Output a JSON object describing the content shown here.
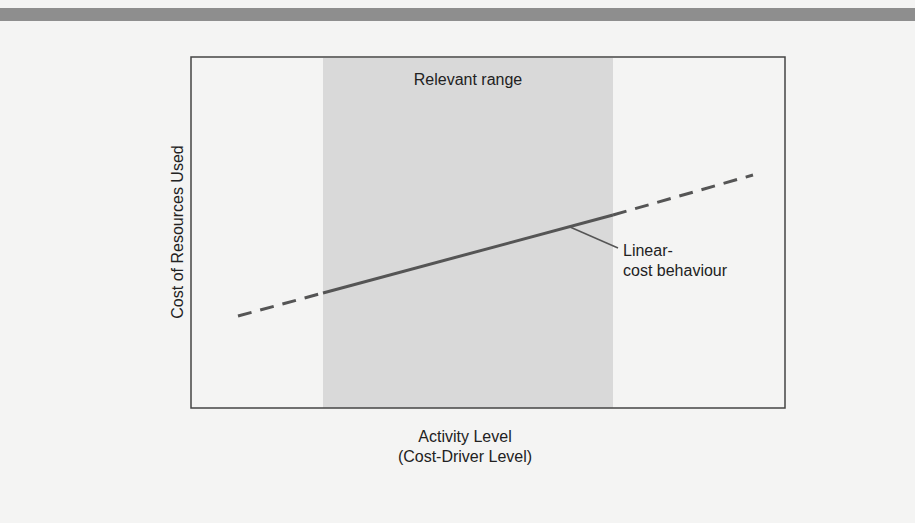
{
  "diagram": {
    "title": "",
    "relevant_range_label": "Relevant range",
    "annotation": {
      "line1": "Linear-",
      "line2": "cost behaviour"
    },
    "x_axis": {
      "line1": "Activity Level",
      "line2": "(Cost-Driver Level)"
    },
    "y_axis": "Cost of Resources Used",
    "colors": {
      "background": "#f4f4f3",
      "shaded_range": "#d9d9d9",
      "line": "#555555",
      "border": "#444444",
      "top_band": "#8e8e8e"
    }
  }
}
